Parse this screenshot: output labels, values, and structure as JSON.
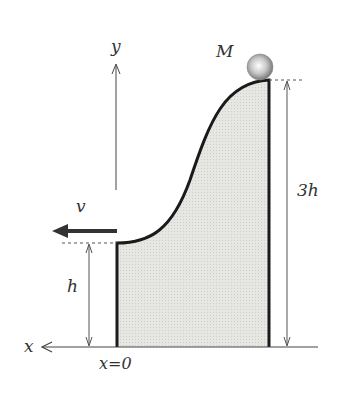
{
  "diagram": {
    "labels": {
      "y_axis": "y",
      "x_axis": "x",
      "mass": "M",
      "velocity": "v",
      "height_low": "h",
      "height_high": "3h",
      "origin": "x=0"
    },
    "colors": {
      "fill": "#e4e4e0",
      "outline": "#1a1a1a",
      "axis": "#444444",
      "ball": "#bdbdbd"
    }
  }
}
